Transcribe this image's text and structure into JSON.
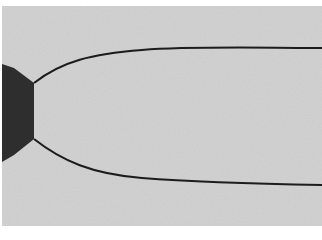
{
  "image": {
    "description": "Grayscale photograph of a dark hexagonal body at the left edge with a thin dark parabolic curve opening to the right",
    "colors": {
      "background": "#d2d2d2",
      "frame": "#ffffff",
      "body": "#2e2e2e",
      "curve": "#1a1a1a"
    }
  }
}
